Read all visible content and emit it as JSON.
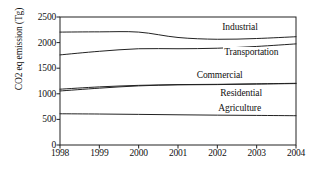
{
  "chart_data": {
    "type": "line",
    "title": "",
    "xlabel": "",
    "ylabel": "CO2 eq emission (Tg)",
    "x": [
      1998,
      1999,
      2000,
      2001,
      2002,
      2003,
      2004
    ],
    "xticklabels": [
      "1998",
      "1999",
      "2000",
      "2001",
      "2002",
      "2003",
      "2004"
    ],
    "yticklabels": [
      "0",
      "500",
      "1000",
      "1500",
      "2000",
      "2500"
    ],
    "yticks": [
      0,
      500,
      1000,
      1500,
      2000,
      2500
    ],
    "xlim": [
      1998,
      2004
    ],
    "ylim": [
      0,
      2500
    ],
    "grid": false,
    "legend_position": "inline-labels",
    "line_color": "#222222",
    "series": [
      {
        "name": "Industrial",
        "values": [
          2205,
          2210,
          2205,
          2100,
          2065,
          2080,
          2115
        ],
        "label_x": 2002.1,
        "label_y": 2290
      },
      {
        "name": "Transportation",
        "values": [
          1760,
          1830,
          1880,
          1880,
          1890,
          1925,
          1975
        ],
        "label_x": 2002.15,
        "label_y": 1805
      },
      {
        "name": "Commercial",
        "values": [
          1090,
          1135,
          1165,
          1180,
          1185,
          1195,
          1205
        ],
        "label_x": 2001.45,
        "label_y": 1345
      },
      {
        "name": "Residential",
        "values": [
          1055,
          1110,
          1155,
          1175,
          1180,
          1190,
          1200
        ],
        "label_x": 2002.05,
        "label_y": 990
      },
      {
        "name": "Agriculture",
        "values": [
          610,
          605,
          598,
          590,
          583,
          578,
          572
        ],
        "label_x": 2002.0,
        "label_y": 700
      }
    ]
  }
}
